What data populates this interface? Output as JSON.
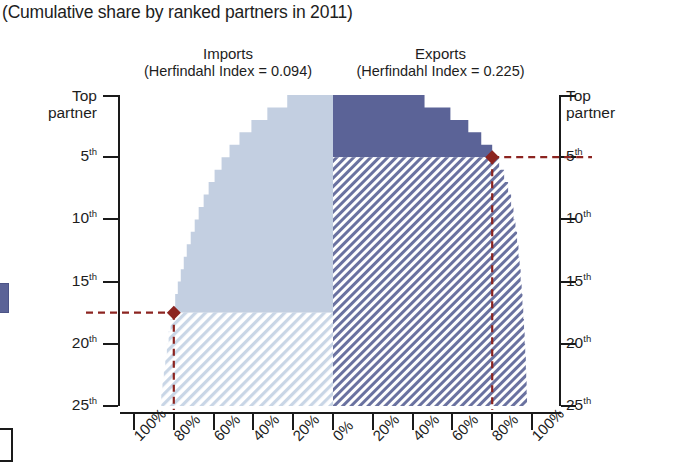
{
  "subtitle": "(Cumulative share by ranked partners in 2011)",
  "panels": {
    "imports": {
      "name": "Imports",
      "herfindahl_label": "(Herfindahl Index = 0.094)"
    },
    "exports": {
      "name": "Exports",
      "herfindahl_label": "(Herfindahl Index = 0.225)"
    }
  },
  "axes": {
    "y_left_label_top": "Top",
    "y_left_label_top2": "partner",
    "y_right_label_top": "Top",
    "y_right_label_top2": "partner",
    "y_ticks": [
      "5",
      "10",
      "15",
      "20",
      "25"
    ],
    "y_tick_suffix": "th",
    "x_left_ticks": [
      "100%",
      "80%",
      "60%",
      "40%",
      "20%",
      "0%"
    ],
    "x_right_ticks": [
      "20%",
      "40%",
      "60%",
      "80%",
      "100%"
    ]
  },
  "colors": {
    "exports_solid": "#5b6397",
    "imports_solid": "#c3cfe1",
    "exports_hatch": "#6a72a0",
    "imports_hatch": "#b9c8de",
    "marker": "#8c2420",
    "axis": "#1a1a1a"
  },
  "markers": {
    "imports": {
      "partner_rank": 17.5,
      "share": "80%",
      "label": "imports-80pct-marker"
    },
    "exports": {
      "partner_rank": 5,
      "share": "80%",
      "label": "exports-80pct-marker"
    }
  },
  "chart_data": {
    "type": "area",
    "title": "(Cumulative share by ranked partners in 2011)",
    "xlabel": "",
    "ylabel": "Partner rank",
    "orientation": "horizontal-butterfly",
    "grid": false,
    "legend_position": "none",
    "x": [
      1,
      2,
      3,
      4,
      5,
      6,
      7,
      8,
      9,
      10,
      11,
      12,
      13,
      14,
      15,
      16,
      17,
      18,
      19,
      20,
      21,
      22,
      23,
      24,
      25
    ],
    "xlim_left": [
      100,
      0
    ],
    "xlim_right": [
      0,
      100
    ],
    "ylim": [
      1,
      25
    ],
    "series": [
      {
        "name": "Imports",
        "side": "left",
        "herfindahl": 0.094,
        "values": [
          23,
          33,
          41,
          47,
          52,
          56,
          59.5,
          62.5,
          65,
          67.5,
          69.5,
          71.5,
          73.5,
          75,
          76.5,
          78,
          79.3,
          80.5,
          81.6,
          82.6,
          83.5,
          84.3,
          85,
          85.7,
          86.3
        ]
      },
      {
        "name": "Exports",
        "side": "right",
        "herfindahl": 0.225,
        "values": [
          46,
          59,
          68,
          74.5,
          80,
          83.5,
          86,
          88,
          89.5,
          90.7,
          91.7,
          92.5,
          93.2,
          93.8,
          94.3,
          94.8,
          95.2,
          95.6,
          96,
          96.3,
          96.6,
          96.9,
          97.1,
          97.3,
          97.5
        ]
      }
    ],
    "annotations": [
      {
        "series": "Imports",
        "text": "80% of imports reached at the 17th-18th partner",
        "x": 80,
        "y": 17.5
      },
      {
        "series": "Exports",
        "text": "80% of exports reached at the 5th partner",
        "x": 80,
        "y": 5
      }
    ]
  }
}
